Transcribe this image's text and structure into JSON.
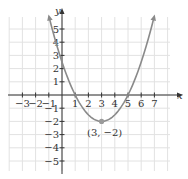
{
  "chart_data": {
    "type": "line",
    "title": "",
    "xlabel": "x",
    "ylabel": "y",
    "xlim": [
      -4,
      8
    ],
    "ylim": [
      -6,
      6
    ],
    "grid": true,
    "x_ticks": [
      -3,
      -2,
      -1,
      1,
      2,
      3,
      4,
      5,
      6,
      7
    ],
    "y_ticks": [
      -5,
      -4,
      -3,
      -2,
      -1,
      1,
      2,
      3,
      4,
      5
    ],
    "x_tick_labels": [
      "−3",
      "−2",
      "−1",
      "1",
      "2",
      "3",
      "4",
      "5",
      "6",
      "7"
    ],
    "y_tick_labels": [
      "−5",
      "−4",
      "−3",
      "−2",
      "−1",
      "1",
      "2",
      "3",
      "4",
      "5"
    ],
    "series": [
      {
        "name": "parabola",
        "equation": "y = 0.5(x - 3)^2 - 2",
        "x": [
          -1,
          0,
          1,
          2,
          3,
          4,
          5,
          6,
          7
        ],
        "y": [
          6,
          2.5,
          0,
          -1.5,
          -2,
          -1.5,
          0,
          2.5,
          6
        ],
        "arrows": "both ends"
      }
    ],
    "points": [
      {
        "x": 3,
        "y": -2,
        "label": "(3, −2)"
      }
    ],
    "annotations": [
      "(3, −2)"
    ]
  },
  "colors": {
    "curve": "#8a8a8a",
    "axis": "#333333",
    "grid": "#e2e2e2",
    "vertex": "#9a9a9a"
  }
}
